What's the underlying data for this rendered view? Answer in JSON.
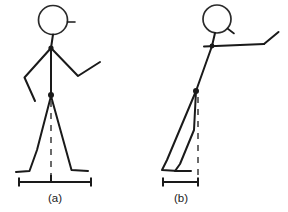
{
  "diagram": {
    "background_color": "#ffffff",
    "stroke_color": "#1a1a1a",
    "dashed_color": "#3a3a3a",
    "panels": [
      {
        "id": "a",
        "caption": "(a)",
        "caption_x": 55,
        "caption_y": 199,
        "description": "Upright stick figure with wide stride stance",
        "head": {
          "cx": 53,
          "cy": 20,
          "r": 14.5,
          "nose": "M 67.5 22 L 75 22"
        },
        "neck": "M 53 34.5 L 51 48",
        "torso": "M 51 48 L 51 96",
        "arm_left": "M 51 48 L 24.5 77.5 L 35 101",
        "arm_right": "M 51 48 L 78 76 L 100 62",
        "leg_back": "M 51 96 L 37 150 L 29.5 171 L 16 172",
        "leg_front": "M 51 96 L 71.5 170 L 88 171",
        "shoulder_dot": {
          "cx": 51,
          "cy": 48,
          "r": 2.6
        },
        "hip_dot": {
          "cx": 51,
          "cy": 95,
          "r": 3.0
        },
        "plumb_line": "M 51 101 L 51 181",
        "measure_bar": {
          "y": 182,
          "x_start": 18,
          "x_end": 92,
          "tick_height": 9,
          "center_tick_x": 51,
          "center_tick_height": 7
        }
      },
      {
        "id": "b",
        "caption": "(b)",
        "caption_x": 181,
        "caption_y": 199,
        "description": "Forward-leaning stick figure with narrow stance",
        "head": {
          "cx": 217,
          "cy": 19,
          "r": 14,
          "nose": "M 227.5 28.5 L 234 33.5"
        },
        "neck": "M 215 33 L 212 46",
        "torso": "M 212 46 L 196 91",
        "arm_left": "M 204 46.5 L 264 44",
        "arm_right": "M 264 44 L 278.5 32",
        "shoulder_dot": {
          "cx": 212,
          "cy": 46,
          "r": 2.4
        },
        "hip_dot": {
          "cx": 196,
          "cy": 91,
          "r": 3.0
        },
        "leg_back": "M 196 91 L 167 160 L 162 170 L 178 171",
        "leg_front": "M 196 91 L 194 130 L 180 164 L 175 171 L 191 171",
        "plumb_line": "M 198 97 L 198 179",
        "measure_bar": {
          "y": 182,
          "x_start": 162,
          "x_end": 199,
          "tick_height": 9,
          "center_tick_x": null,
          "center_tick_height": 0
        }
      }
    ]
  }
}
